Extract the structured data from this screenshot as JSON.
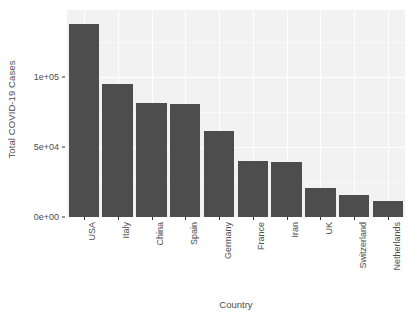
{
  "chart_data": {
    "type": "bar",
    "title": "",
    "subtitle": "",
    "xlabel": "Country",
    "ylabel": "Total COVID-19 Cases",
    "categories": [
      "USA",
      "Italy",
      "China",
      "Spain",
      "Germany",
      "France",
      "Iran",
      "UK",
      "Switzerland",
      "Netherlands"
    ],
    "values": [
      138000,
      95000,
      81400,
      80700,
      61400,
      40000,
      39300,
      20700,
      15700,
      11400
    ],
    "ylim": [
      0,
      148000
    ],
    "y_tick_labels": [
      "0e+00",
      "5e+04",
      "1e+05"
    ],
    "y_tick_values": [
      0,
      50000,
      100000
    ],
    "grid": true,
    "legend": "none",
    "bar_color": "#4d4d4d",
    "panel_background": "#f2f2f2",
    "gridline_color": "#ffffff",
    "axis_text_color": "#4d4d4d"
  }
}
